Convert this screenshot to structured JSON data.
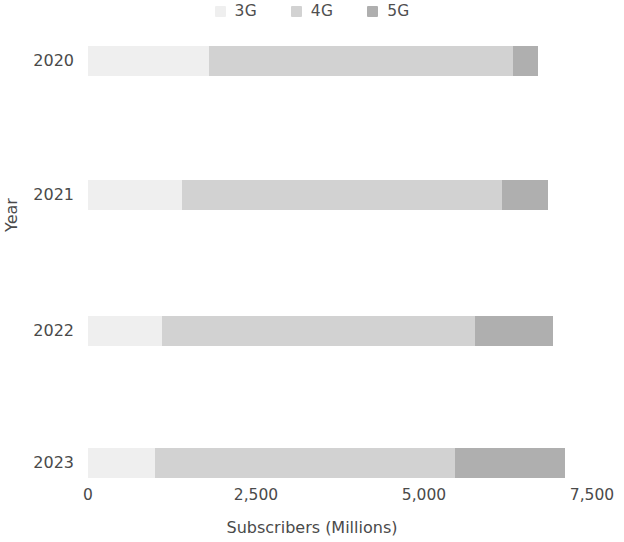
{
  "chart_data": {
    "type": "bar",
    "orientation": "horizontal",
    "stacked": true,
    "title": "",
    "xlabel": "Subscribers (Millions)",
    "ylabel": "Year",
    "categories": [
      "2020",
      "2021",
      "2022",
      "2023"
    ],
    "series": [
      {
        "name": "3G",
        "color": "#efefef",
        "values": [
          1800,
          1400,
          1100,
          1000
        ]
      },
      {
        "name": "4G",
        "color": "#d2d2d2",
        "values": [
          4525,
          4760,
          4660,
          4460
        ]
      },
      {
        "name": "5G",
        "color": "#afafaf",
        "values": [
          375,
          690,
          1160,
          1640
        ]
      }
    ],
    "totals": [
      6700,
      6850,
      6920,
      7100
    ],
    "xlim": [
      0,
      7500
    ],
    "xticks": [
      0,
      2500,
      5000,
      7500
    ],
    "xticklabels": [
      "0",
      "2,500",
      "5,000",
      "7,500"
    ],
    "grid": false,
    "legend_position": "top-center"
  },
  "legend": {
    "entries": [
      {
        "label": "3G",
        "color": "#efefef"
      },
      {
        "label": "4G",
        "color": "#d2d2d2"
      },
      {
        "label": "5G",
        "color": "#afafaf"
      }
    ]
  },
  "axes": {
    "x_title": "Subscribers (Millions)",
    "y_title": "Year",
    "x_ticks": [
      "0",
      "2,500",
      "5,000",
      "7,500"
    ],
    "y_ticks": [
      "2020",
      "2021",
      "2022",
      "2023"
    ]
  }
}
